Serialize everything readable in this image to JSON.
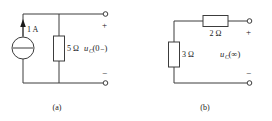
{
  "figure": {
    "name": "two-circuit-diagram",
    "background_color": "#ffffff",
    "line_color": "#3c3c3c",
    "text_color": "#1a1a1a"
  },
  "circuit_a": {
    "caption": "(a)",
    "source": {
      "type": "current-source",
      "label": "1 A",
      "direction": "up"
    },
    "resistor": {
      "label": "5 Ω",
      "orientation": "vertical"
    },
    "output": {
      "label_main": "u",
      "label_sub": "C",
      "label_arg": "(0₋)",
      "plus": "+",
      "minus": "−"
    }
  },
  "circuit_b": {
    "caption": "(b)",
    "series_resistor": {
      "label": "2 Ω",
      "orientation": "horizontal"
    },
    "shunt_resistor": {
      "label": "3 Ω",
      "orientation": "vertical"
    },
    "output": {
      "label_main": "u",
      "label_sub": "C",
      "label_arg": "(∞)",
      "plus": "+",
      "minus": "−"
    }
  }
}
